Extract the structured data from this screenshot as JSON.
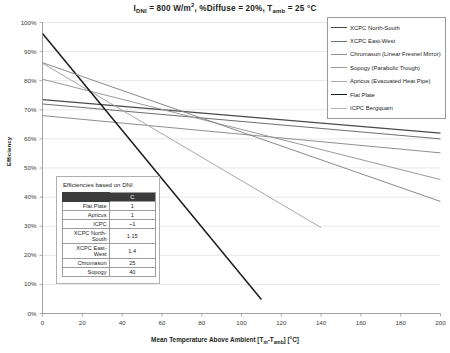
{
  "chart_data": {
    "type": "line",
    "title_parts": {
      "i_sym": "I",
      "i_sub": "DNI",
      "i_val": " = 800 W/m",
      "i_sup": "2",
      "diffuse": ", %Diffuse = 20%, ",
      "t_sym": "T",
      "t_sub": "amb",
      "t_val": " = 25 °C"
    },
    "xlabel": "Mean Temperature Above Ambient [Tm-Tamb] [°C]",
    "xlabel_parts": {
      "pre": "Mean Temperature Above Ambient [T",
      "sub1": "m",
      "mid": "-T",
      "sub2": "amb",
      "post": "] [°C]"
    },
    "ylabel": "Efficiency",
    "xlim": [
      0,
      200
    ],
    "ylim": [
      0,
      1.0
    ],
    "xticks": [
      "0",
      "20",
      "40",
      "60",
      "80",
      "100",
      "120",
      "140",
      "160",
      "180",
      "200"
    ],
    "yticks": [
      "0%",
      "10%",
      "20%",
      "30%",
      "40%",
      "50%",
      "60%",
      "70%",
      "80%",
      "90%",
      "100%"
    ],
    "grid": "horizontal",
    "legend_position": "top-right",
    "series": [
      {
        "name": "XCPC North-South",
        "color": "#4a4a4a",
        "width": 1.15,
        "points": [
          [
            0,
            0.735
          ],
          [
            200,
            0.62
          ]
        ]
      },
      {
        "name": "XCPC East-West",
        "color": "#6e6e6e",
        "width": 1.0,
        "points": [
          [
            0,
            0.72
          ],
          [
            200,
            0.6
          ]
        ]
      },
      {
        "name": "Chromasun (Linear Fresnel Mirror)",
        "color": "#8f8f8f",
        "width": 1.0,
        "points": [
          [
            0,
            0.68
          ],
          [
            200,
            0.552
          ]
        ]
      },
      {
        "name": "Sopogy (Parabolic Trough)",
        "color": "#9a9a9a",
        "width": 1.0,
        "points": [
          [
            0,
            0.805
          ],
          [
            200,
            0.46
          ]
        ]
      },
      {
        "name": "Apricus (Evacuated Heat Pipe)",
        "color": "#a8a8a8",
        "width": 1.0,
        "points": [
          [
            0,
            0.86
          ],
          [
            140,
            0.295
          ]
        ]
      },
      {
        "name": "Flat Plate",
        "color": "#1c1c1c",
        "width": 1.5,
        "points": [
          [
            0,
            0.962
          ],
          [
            110,
            0.048
          ]
        ]
      },
      {
        "name": "ICPC Bergquam",
        "color": "#8a8a8a",
        "width": 1.0,
        "points": [
          [
            0,
            0.862
          ],
          [
            200,
            0.385
          ]
        ]
      }
    ]
  },
  "legend": {
    "items": [
      {
        "label": "XCPC North-South",
        "color": "#4a4a4a",
        "width": "1.4px"
      },
      {
        "label": "XCPC East-West",
        "color": "#6e6e6e",
        "width": "1.1px"
      },
      {
        "label": "Chromasun (Linear Fresnel Mirror)",
        "color": "#8f8f8f",
        "width": "1.1px"
      },
      {
        "label": "Sopogy (Parabolic Trough)",
        "color": "#9a9a9a",
        "width": "1.1px"
      },
      {
        "label": "Apricus (Evacuated Heat Pipe)",
        "color": "#a8a8a8",
        "width": "1.1px"
      },
      {
        "label": "Flat Plate",
        "color": "#1c1c1c",
        "width": "1.8px"
      },
      {
        "label": "ICPC Bergquam",
        "color": "#b4b4b4",
        "width": "1.1px"
      }
    ]
  },
  "inset_table": {
    "title": "Efficiencies based on DNI",
    "headers": [
      "",
      "C"
    ],
    "rows": [
      {
        "name": "Flat Plate",
        "c": "1"
      },
      {
        "name": "Apricus",
        "c": "1"
      },
      {
        "name": "ICPC",
        "c": "~1"
      },
      {
        "name": "XCPC North-South",
        "c": "1.15"
      },
      {
        "name": "XCPC East-West",
        "c": "1.4"
      },
      {
        "name": "Chromasun",
        "c": "25"
      },
      {
        "name": "Sopogy",
        "c": "40"
      }
    ]
  }
}
